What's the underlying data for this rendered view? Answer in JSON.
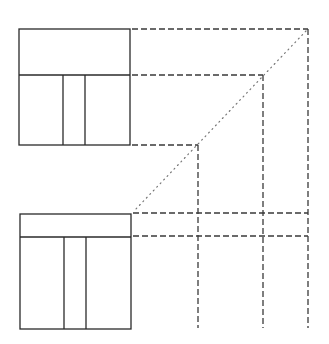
{
  "diagram": {
    "type": "orthographic-projection",
    "canvas": {
      "width": 329,
      "height": 344,
      "background": "#ffffff"
    },
    "colors": {
      "solid": "#2a2a2a",
      "dashed": "#3a3a3a",
      "dotted": "#777777"
    },
    "top_view": {
      "x1": 19,
      "y1": 29,
      "x2": 130,
      "y2": 145,
      "divider_y": 75,
      "verticals_x": [
        63,
        85
      ]
    },
    "front_view": {
      "x1": 20,
      "y1": 214,
      "x2": 131,
      "y2": 329,
      "divider_y": 237,
      "verticals_x": [
        64,
        86
      ]
    },
    "projection_lines": {
      "horizontal_top": [
        {
          "y": 29,
          "x_end": 308
        },
        {
          "y": 75,
          "x_end": 263
        },
        {
          "y": 145,
          "x_end": 198
        }
      ],
      "verticals": [
        {
          "x": 198,
          "y_start": 145,
          "y_end": 328
        },
        {
          "x": 263,
          "y_start": 75,
          "y_end": 328
        },
        {
          "x": 308,
          "y_start": 29,
          "y_end": 328
        }
      ],
      "horizontal_bottom": [
        {
          "y": 213,
          "x_start": 131,
          "x_end": 308
        },
        {
          "y": 236,
          "x_start": 131,
          "x_end": 308
        }
      ],
      "miter_line": {
        "x1": 308,
        "y1": 29,
        "x2": 133,
        "y2": 212
      }
    }
  }
}
